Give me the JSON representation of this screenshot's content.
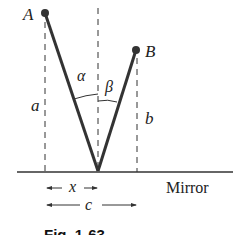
{
  "diagram": {
    "points": {
      "A": "A",
      "B": "B"
    },
    "angles": {
      "alpha": "α",
      "beta": "β"
    },
    "lengths": {
      "a": "a",
      "b": "b",
      "x": "x",
      "c": "c"
    },
    "surface_label": "Mirror",
    "caption": "Fig. 1-63"
  }
}
